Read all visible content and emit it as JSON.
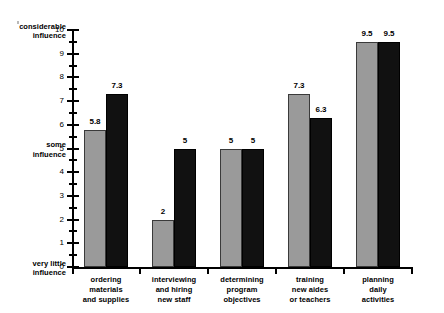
{
  "chart_data": {
    "type": "bar",
    "title": "",
    "xlabel": "",
    "ylabel": "",
    "ylim": [
      0,
      10
    ],
    "ytick_step": 1,
    "yminor_step": 0.5,
    "grid": false,
    "legend": "none",
    "categories": [
      "ordering materials and supplies",
      "interviewing and hiring new staff",
      "determining program objectives",
      "training new aides or teachers",
      "planning daily activities"
    ],
    "category_lines": [
      [
        "ordering",
        "materials",
        "and supplies"
      ],
      [
        "interviewing",
        "and hiring",
        "new staff"
      ],
      [
        "determining",
        "program",
        "objectives"
      ],
      [
        "training",
        "new aides",
        "or teachers"
      ],
      [
        "planning",
        "daily",
        "activities"
      ]
    ],
    "series": [
      {
        "name": "light",
        "color": "#9a9a9a",
        "values": [
          5.8,
          2,
          5,
          7.3,
          9.5
        ],
        "labels": [
          "5.8",
          "2",
          "5",
          "7.3",
          "9.5"
        ]
      },
      {
        "name": "dark",
        "color": "#111111",
        "values": [
          7.3,
          5,
          5,
          6.3,
          9.5
        ],
        "labels": [
          "7.3",
          "5",
          "5",
          "6.3",
          "9.5"
        ]
      }
    ],
    "ytick_labels": [
      "0",
      "1",
      "2",
      "3",
      "4",
      "5",
      "6",
      "7",
      "8",
      "9",
      "10"
    ],
    "y_anchor_labels": [
      {
        "value": 10,
        "lines": [
          "considerable",
          "influence"
        ]
      },
      {
        "value": 5,
        "lines": [
          "some",
          "influence"
        ]
      },
      {
        "value": 0,
        "lines": [
          "very little",
          "influence"
        ]
      }
    ]
  }
}
